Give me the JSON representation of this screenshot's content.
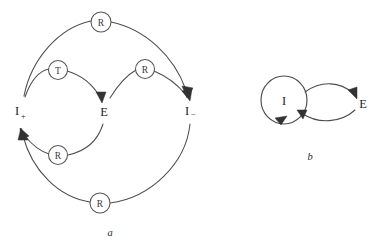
{
  "figure": {
    "background_color": "#ffffff",
    "line_color": "#4d4d4d",
    "text_color": "#1f1f1f",
    "panels": [
      {
        "id": "a",
        "caption": "a",
        "caption_pos": {
          "x": 110,
          "y": 236
        },
        "states": [
          {
            "id": "i-plus",
            "base": "I",
            "sub": "+",
            "x": 20,
            "y": 110
          },
          {
            "id": "e",
            "base": "E",
            "sub": "",
            "x": 104,
            "y": 111
          },
          {
            "id": "i-minus",
            "base": "I",
            "sub": "−",
            "x": 190,
            "y": 110
          }
        ],
        "badges": [
          {
            "id": "badge-top",
            "label": "R",
            "cx": 101,
            "cy": 22,
            "r": 10
          },
          {
            "id": "badge-upper-left",
            "label": "T",
            "cx": 58,
            "cy": 70,
            "r": 9.5
          },
          {
            "id": "badge-upper-right",
            "label": "R",
            "cx": 145,
            "cy": 69,
            "r": 9.5
          },
          {
            "id": "badge-lower-left",
            "label": "R",
            "cx": 58,
            "cy": 155,
            "r": 9.5
          },
          {
            "id": "badge-bottom",
            "label": "R",
            "cx": 100,
            "cy": 203,
            "r": 10
          }
        ],
        "transitions": [
          {
            "id": "t-iplus-to-e",
            "from": "I+",
            "to": "E",
            "label": "T"
          },
          {
            "id": "r-e-to-iminus",
            "from": "E",
            "to": "I-",
            "label": "R"
          },
          {
            "id": "r-iplus-to-iminus",
            "from": "I+",
            "to": "I-",
            "label": "R"
          },
          {
            "id": "r-e-to-iplus",
            "from": "E",
            "to": "I+",
            "label": "R"
          },
          {
            "id": "r-iminus-to-iplus",
            "from": "I-",
            "to": "I+",
            "label": "R"
          }
        ]
      },
      {
        "id": "b",
        "caption": "b",
        "caption_pos": {
          "x": 310,
          "y": 160
        },
        "states": [
          {
            "id": "i",
            "base": "I",
            "sub": "",
            "x": 284,
            "y": 103
          },
          {
            "id": "e2",
            "base": "E",
            "sub": "",
            "x": 360,
            "y": 103
          }
        ],
        "node_circle": {
          "cx": 284,
          "cy": 100,
          "rx": 23,
          "ry": 24
        },
        "transitions": [
          {
            "id": "i-self-loop",
            "from": "I",
            "to": "I",
            "label": ""
          },
          {
            "id": "i-to-e",
            "from": "I",
            "to": "E",
            "label": ""
          },
          {
            "id": "e-to-i",
            "from": "E",
            "to": "I",
            "label": ""
          }
        ]
      }
    ]
  }
}
